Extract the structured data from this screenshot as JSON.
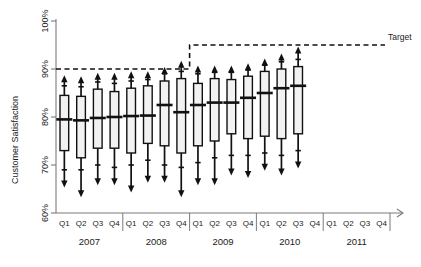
{
  "chart_data": {
    "type": "box",
    "title": "",
    "xlabel": "",
    "ylabel": "Customer Satisfaction",
    "ylim": [
      60,
      100
    ],
    "ytick_labels": [
      "60%",
      "70%",
      "80%",
      "90%",
      "100%"
    ],
    "ytick_values": [
      60,
      70,
      80,
      90,
      100
    ],
    "grid": false,
    "legend_position": "right",
    "quarters": [
      "Q1",
      "Q2",
      "Q3",
      "Q4"
    ],
    "years": [
      "2007",
      "2008",
      "2009",
      "2010",
      "2011"
    ],
    "categories": [
      "2007 Q1",
      "2007 Q2",
      "2007 Q3",
      "2007 Q4",
      "2008 Q1",
      "2008 Q2",
      "2008 Q3",
      "2008 Q4",
      "2009 Q1",
      "2009 Q2",
      "2009 Q3",
      "2009 Q4",
      "2010 Q1",
      "2010 Q2",
      "2010 Q3",
      "2010 Q4",
      "2011 Q1",
      "2011 Q2",
      "2011 Q3",
      "2011 Q4"
    ],
    "annotations": [
      {
        "label": "Target",
        "kind": "step-line",
        "values": [
          90,
          95
        ],
        "step_at": "2009 Q1",
        "style": "dashed"
      }
    ],
    "series": [
      {
        "name": "Customer Satisfaction distribution",
        "boxes": [
          {
            "category": "2007 Q1",
            "whisker_low": 65.5,
            "q1": 73.0,
            "median": 79.5,
            "q3": 84.5,
            "whisker_high": 88.5,
            "inner_low": 69.0,
            "inner_high": 86.5
          },
          {
            "category": "2007 Q2",
            "whisker_low": 63.5,
            "q1": 71.5,
            "median": 79.3,
            "q3": 84.3,
            "whisker_high": 88.3,
            "inner_low": 69.0,
            "inner_high": 86.3
          },
          {
            "category": "2007 Q3",
            "whisker_low": 66.0,
            "q1": 73.5,
            "median": 79.8,
            "q3": 85.8,
            "whisker_high": 89.0,
            "inner_low": 70.0,
            "inner_high": 87.3
          },
          {
            "category": "2007 Q4",
            "whisker_low": 66.0,
            "q1": 73.5,
            "median": 80.0,
            "q3": 85.3,
            "whisker_high": 89.0,
            "inner_low": 69.5,
            "inner_high": 87.0
          },
          {
            "category": "2008 Q1",
            "whisker_low": 64.5,
            "q1": 72.5,
            "median": 80.2,
            "q3": 86.0,
            "whisker_high": 89.3,
            "inner_low": 70.0,
            "inner_high": 87.5
          },
          {
            "category": "2008 Q2",
            "whisker_low": 66.5,
            "q1": 74.5,
            "median": 80.3,
            "q3": 86.5,
            "whisker_high": 89.3,
            "inner_low": 71.0,
            "inner_high": 87.8
          },
          {
            "category": "2008 Q3",
            "whisker_low": 66.5,
            "q1": 74.0,
            "median": 82.5,
            "q3": 87.5,
            "whisker_high": 90.2,
            "inner_low": 70.0,
            "inner_high": 89.0
          },
          {
            "category": "2008 Q4",
            "whisker_low": 63.5,
            "q1": 72.5,
            "median": 81.0,
            "q3": 88.0,
            "whisker_high": 91.5,
            "inner_low": 69.5,
            "inner_high": 89.5
          },
          {
            "category": "2009 Q1",
            "whisker_low": 66.0,
            "q1": 74.0,
            "median": 82.5,
            "q3": 87.0,
            "whisker_high": 90.5,
            "inner_low": 70.5,
            "inner_high": 89.0
          },
          {
            "category": "2009 Q2",
            "whisker_low": 66.0,
            "q1": 75.0,
            "median": 83.0,
            "q3": 88.0,
            "whisker_high": 90.5,
            "inner_low": 71.5,
            "inner_high": 89.3
          },
          {
            "category": "2009 Q3",
            "whisker_low": 68.0,
            "q1": 76.5,
            "median": 83.0,
            "q3": 87.8,
            "whisker_high": 90.5,
            "inner_low": 72.0,
            "inner_high": 89.3
          },
          {
            "category": "2009 Q4",
            "whisker_low": 67.5,
            "q1": 75.5,
            "median": 84.0,
            "q3": 88.5,
            "whisker_high": 91.0,
            "inner_low": 72.0,
            "inner_high": 89.8
          },
          {
            "category": "2010 Q1",
            "whisker_low": 69.0,
            "q1": 76.0,
            "median": 85.0,
            "q3": 89.5,
            "whisker_high": 92.0,
            "inner_low": 72.5,
            "inner_high": 90.8
          },
          {
            "category": "2010 Q2",
            "whisker_low": 68.0,
            "q1": 75.5,
            "median": 86.0,
            "q3": 90.0,
            "whisker_high": 93.0,
            "inner_low": 72.0,
            "inner_high": 91.5
          },
          {
            "category": "2010 Q3",
            "whisker_low": 69.5,
            "q1": 76.5,
            "median": 86.5,
            "q3": 90.5,
            "whisker_high": 94.5,
            "inner_low": 73.0,
            "inner_high": 92.0
          }
        ]
      }
    ]
  },
  "axes": {
    "y_title": "Customer Satisfaction",
    "y_ticks": [
      "100%",
      "90%",
      "80%",
      "70%",
      "60%"
    ]
  },
  "target": {
    "label": "Target"
  }
}
